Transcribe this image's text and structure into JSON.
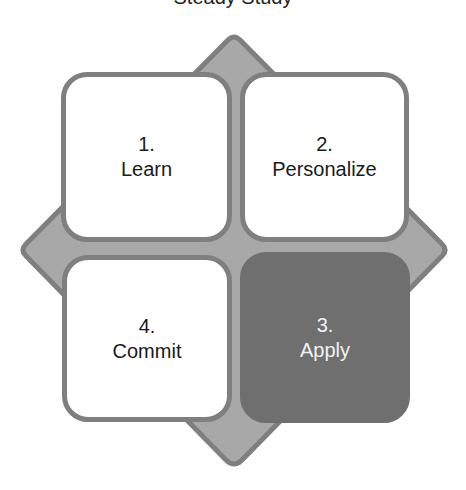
{
  "diagram": {
    "title": "Steady Study",
    "colors": {
      "diamond_fill": "#a8a8a8",
      "diamond_border": "#7f7f7f",
      "box_fill": "#ffffff",
      "box_border": "#7f7f7f",
      "active_box_fill": "#6f6f6f",
      "active_text": "#f2f2f2",
      "text": "#1a1a1a"
    },
    "steps": [
      {
        "num": "1.",
        "label": "Learn",
        "active": false
      },
      {
        "num": "2.",
        "label": "Personalize",
        "active": false
      },
      {
        "num": "3.",
        "label": "Apply",
        "active": true
      },
      {
        "num": "4.",
        "label": "Commit",
        "active": false
      }
    ]
  }
}
